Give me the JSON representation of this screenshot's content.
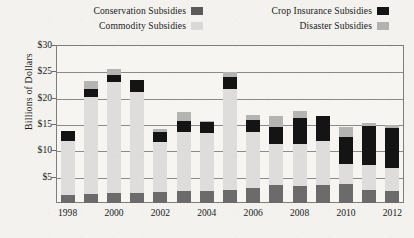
{
  "chart_data": {
    "type": "bar",
    "subtype": "stacked-bar",
    "title": "",
    "xlabel": "",
    "ylabel": "Billions of Dollars",
    "ylim": [
      0,
      30
    ],
    "ytick_values": [
      5,
      10,
      15,
      20,
      25,
      30
    ],
    "ytick_labels": [
      "$5",
      "$10",
      "$15",
      "$20",
      "$25",
      "$30"
    ],
    "grid": true,
    "legend_position": "top",
    "categories": [
      1998,
      1999,
      2000,
      2001,
      2002,
      2003,
      2004,
      2005,
      2006,
      2007,
      2008,
      2009,
      2010,
      2011,
      2012
    ],
    "xtick_labels": [
      "1998",
      "2000",
      "2002",
      "2004",
      "2006",
      "2008",
      "2010",
      "2012"
    ],
    "xtick_categories": [
      1998,
      2000,
      2002,
      2004,
      2006,
      2008,
      2010,
      2012
    ],
    "series": [
      {
        "name": "Conservation Subsidies",
        "color": "#6b6b6b",
        "values": [
          1.6,
          1.8,
          1.9,
          1.9,
          2.0,
          2.2,
          2.3,
          2.5,
          2.8,
          3.4,
          3.2,
          3.4,
          3.6,
          2.4,
          2.3
        ]
      },
      {
        "name": "Commodity Subsidies",
        "color": "#dedddb",
        "values": [
          10.1,
          18.4,
          21.0,
          19.2,
          9.5,
          11.2,
          10.9,
          19.2,
          10.6,
          7.8,
          8.0,
          8.3,
          3.9,
          4.9,
          4.4
        ]
      },
      {
        "name": "Crop Insurance Subsidies",
        "color": "#141414",
        "values": [
          1.9,
          1.4,
          1.5,
          2.2,
          1.9,
          2.2,
          2.2,
          2.3,
          2.3,
          3.2,
          5.0,
          4.8,
          5.0,
          7.3,
          7.6
        ]
      },
      {
        "name": "Disaster Subsidies",
        "color": "#b4b4b2",
        "values": [
          0.0,
          1.5,
          1.1,
          0.0,
          0.7,
          1.6,
          0.2,
          0.8,
          1.1,
          2.2,
          1.3,
          0.1,
          1.9,
          0.6,
          0.5
        ]
      }
    ],
    "totals": [
      13.6,
      23.1,
      25.5,
      23.3,
      14.1,
      17.2,
      15.6,
      24.8,
      16.8,
      16.6,
      17.5,
      16.6,
      14.4,
      15.2,
      14.8
    ]
  },
  "legend": {
    "entries": [
      {
        "label": "Conservation Subsidies",
        "swatch": "conservation-swatch"
      },
      {
        "label": "Crop Insurance Subsidies",
        "swatch": "crop-insurance-swatch"
      },
      {
        "label": "Commodity Subsidies",
        "swatch": "commodity-swatch"
      },
      {
        "label": "Disaster Subsidies",
        "swatch": "disaster-swatch"
      }
    ]
  },
  "axes": {
    "y_title": "Billions of Dollars"
  }
}
